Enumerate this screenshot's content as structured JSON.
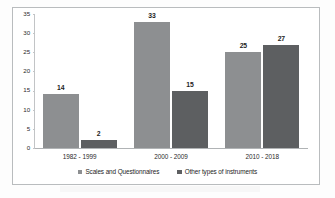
{
  "chart_data": {
    "type": "bar",
    "title": "",
    "xlabel": "",
    "ylabel": "",
    "categories": [
      "1982 - 1999",
      "2000 - 2009",
      "2010 - 2018"
    ],
    "series": [
      {
        "name": "Scales and Questionnaires",
        "color": "#8d8f91",
        "values": [
          14,
          33,
          25
        ]
      },
      {
        "name": "Other types of instruments",
        "color": "#5d5f61",
        "values": [
          2,
          15,
          27
        ]
      }
    ],
    "ylim": [
      0,
      35
    ],
    "yticks": [
      0,
      5,
      10,
      15,
      20,
      25,
      30,
      35
    ],
    "ytick_labels": [
      "0",
      "5",
      "10",
      "15",
      "20",
      "25",
      "30",
      "35"
    ],
    "grid": false,
    "legend_position": "bottom",
    "data_labels": true,
    "border": true
  },
  "colors": {
    "series1": "#8d8f91",
    "series2": "#5d5f61",
    "axis": "#b9bcbe",
    "text": "#1d1d1d",
    "plot_background": "#ffffff"
  }
}
